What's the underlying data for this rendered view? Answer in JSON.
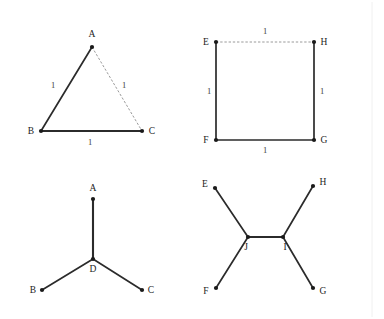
{
  "page": {
    "background_color": "#ffffff",
    "edge_color": "#2b2b2b",
    "dashed_edge_color": "#9a9a9a",
    "label_color": "#1c1c1c",
    "weight_color": "#3a3a3a",
    "rule_color": "#f0f0f0"
  },
  "figures": [
    {
      "id": "triangle-spanning-tree",
      "name": "Equilateral triangle with unit edges",
      "vertices": [
        {
          "label": "A",
          "x": 92,
          "y": 47,
          "label_x": 92,
          "label_y": 37,
          "anchor": "middle"
        },
        {
          "label": "B",
          "x": 41,
          "y": 131,
          "label_x": 31,
          "label_y": 134,
          "anchor": "middle"
        },
        {
          "label": "C",
          "x": 142,
          "y": 131,
          "label_x": 152,
          "label_y": 134,
          "anchor": "middle"
        }
      ],
      "edges": [
        {
          "from": "A",
          "to": "B",
          "style": "solid",
          "weight": "1",
          "weight_x": 53,
          "weight_y": 88
        },
        {
          "from": "B",
          "to": "C",
          "style": "heavy",
          "weight": "1",
          "weight_x": 90,
          "weight_y": 145
        },
        {
          "from": "A",
          "to": "C",
          "style": "dashed",
          "weight": "1",
          "weight_x": 124,
          "weight_y": 88
        }
      ]
    },
    {
      "id": "square-spanning-tree",
      "name": "Unit square with dashed top edge",
      "vertices": [
        {
          "label": "E",
          "x": 216,
          "y": 42,
          "label_x": 206,
          "label_y": 45,
          "anchor": "middle"
        },
        {
          "label": "H",
          "x": 314,
          "y": 42,
          "label_x": 324,
          "label_y": 45,
          "anchor": "middle"
        },
        {
          "label": "F",
          "x": 216,
          "y": 140,
          "label_x": 206,
          "label_y": 143,
          "anchor": "middle"
        },
        {
          "label": "G",
          "x": 314,
          "y": 140,
          "label_x": 324,
          "label_y": 143,
          "anchor": "middle"
        }
      ],
      "edges": [
        {
          "from": "E",
          "to": "H",
          "style": "dashed",
          "weight": "1",
          "weight_x": 265,
          "weight_y": 34
        },
        {
          "from": "E",
          "to": "F",
          "style": "solid",
          "weight": "1",
          "weight_x": 209,
          "weight_y": 94
        },
        {
          "from": "H",
          "to": "G",
          "style": "solid",
          "weight": "1",
          "weight_x": 322,
          "weight_y": 94
        },
        {
          "from": "F",
          "to": "G",
          "style": "solid",
          "weight": "1",
          "weight_x": 265,
          "weight_y": 153
        }
      ]
    },
    {
      "id": "triangle-steiner-tree",
      "name": "Steiner tree for triangle with one Steiner point D",
      "vertices": [
        {
          "label": "A",
          "x": 93,
          "y": 199,
          "label_x": 93,
          "label_y": 191,
          "anchor": "middle"
        },
        {
          "label": "B",
          "x": 42,
          "y": 290,
          "label_x": 33,
          "label_y": 293,
          "anchor": "middle"
        },
        {
          "label": "C",
          "x": 142,
          "y": 290,
          "label_x": 151,
          "label_y": 293,
          "anchor": "middle"
        },
        {
          "label": "D",
          "x": 93,
          "y": 259,
          "label_x": 93,
          "label_y": 272,
          "anchor": "middle"
        }
      ],
      "edges": [
        {
          "from": "D",
          "to": "A",
          "style": "heavy",
          "weight": "",
          "weight_x": 0,
          "weight_y": 0
        },
        {
          "from": "D",
          "to": "B",
          "style": "solid",
          "weight": "",
          "weight_x": 0,
          "weight_y": 0
        },
        {
          "from": "D",
          "to": "C",
          "style": "solid",
          "weight": "",
          "weight_x": 0,
          "weight_y": 0
        }
      ]
    },
    {
      "id": "square-steiner-tree",
      "name": "Steiner tree for square with two Steiner points J and I",
      "vertices": [
        {
          "label": "E",
          "x": 215,
          "y": 188,
          "label_x": 205,
          "label_y": 187,
          "anchor": "middle"
        },
        {
          "label": "H",
          "x": 313,
          "y": 186,
          "label_x": 323,
          "label_y": 185,
          "anchor": "middle"
        },
        {
          "label": "F",
          "x": 216,
          "y": 288,
          "label_x": 206,
          "label_y": 294,
          "anchor": "middle"
        },
        {
          "label": "G",
          "x": 313,
          "y": 288,
          "label_x": 323,
          "label_y": 294,
          "anchor": "middle"
        },
        {
          "label": "J",
          "x": 248,
          "y": 237,
          "label_x": 246,
          "label_y": 250,
          "anchor": "middle"
        },
        {
          "label": "I",
          "x": 283,
          "y": 237,
          "label_x": 285,
          "label_y": 250,
          "anchor": "middle"
        }
      ],
      "edges": [
        {
          "from": "J",
          "to": "E",
          "style": "solid",
          "weight": "",
          "weight_x": 0,
          "weight_y": 0
        },
        {
          "from": "J",
          "to": "F",
          "style": "solid",
          "weight": "",
          "weight_x": 0,
          "weight_y": 0
        },
        {
          "from": "J",
          "to": "I",
          "style": "heavy",
          "weight": "",
          "weight_x": 0,
          "weight_y": 0
        },
        {
          "from": "I",
          "to": "H",
          "style": "solid",
          "weight": "",
          "weight_x": 0,
          "weight_y": 0
        },
        {
          "from": "I",
          "to": "G",
          "style": "solid",
          "weight": "",
          "weight_x": 0,
          "weight_y": 0
        }
      ]
    }
  ],
  "page_rule": {
    "x": 372,
    "y1": 2,
    "y2": 317
  }
}
